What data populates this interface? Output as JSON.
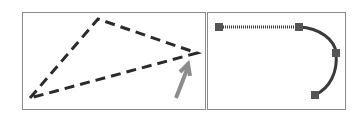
{
  "panels": [
    {
      "id": "dashed-triangle-panel",
      "description": "dashed triangle with grey arrow pointing to right vertex",
      "stroke_color": "#2b2b2b",
      "arrow_color": "#8c8c8c",
      "vertices": [
        [
          98,
          19
        ],
        [
          197,
          53
        ],
        [
          30,
          98
        ]
      ],
      "arrow": {
        "from": [
          176,
          98
        ],
        "to": [
          189,
          64
        ]
      }
    },
    {
      "id": "path-handles-panel",
      "description": "path with straight segment and curve, square anchor handles",
      "stroke_color": "#3a3a3a",
      "handle_color": "#555555",
      "handles": [
        [
          219,
          27
        ],
        [
          299,
          27
        ],
        [
          336,
          53
        ],
        [
          315,
          95
        ]
      ]
    }
  ],
  "colors": {
    "border": "#8a8a8a",
    "background": "#ffffff"
  }
}
